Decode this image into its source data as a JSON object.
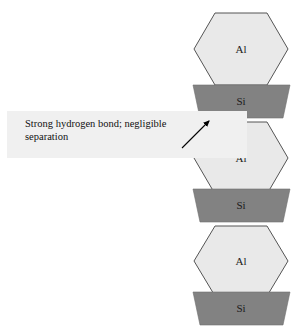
{
  "diagram": {
    "colors": {
      "al_fill": "#e9e9e9",
      "al_stroke": "#555555",
      "si_fill": "#828282",
      "si_stroke": "#6e6e6e",
      "annotation_background": "#f0f0f0",
      "text": "#111111",
      "arrow": "#000000",
      "page_background": "#ffffff"
    },
    "layers": [
      {
        "id": "al-1",
        "label": "Al",
        "kind": "hexagon",
        "cx": 241,
        "cy": 49
      },
      {
        "id": "si-1",
        "label": "Si",
        "kind": "trapezoid",
        "cx": 241,
        "cy": 101
      },
      {
        "id": "al-2",
        "label": "Al",
        "kind": "hexagon",
        "cx": 241,
        "cy": 158
      },
      {
        "id": "si-2",
        "label": "Si",
        "kind": "trapezoid",
        "cx": 241,
        "cy": 205
      },
      {
        "id": "al-3",
        "label": "Al",
        "kind": "hexagon",
        "cx": 241,
        "cy": 261
      },
      {
        "id": "si-3",
        "label": "Si",
        "kind": "trapezoid",
        "cx": 241,
        "cy": 309
      }
    ],
    "annotation": {
      "text": "Strong hydrogen bond; negligible\nseparation",
      "line_1": "Strong hydrogen bond; negligible",
      "line_2": "separation"
    },
    "arrow": {
      "name": "annotation-arrow",
      "from": {
        "x": 182,
        "y": 148
      },
      "to": {
        "x": 212,
        "y": 119
      }
    }
  }
}
